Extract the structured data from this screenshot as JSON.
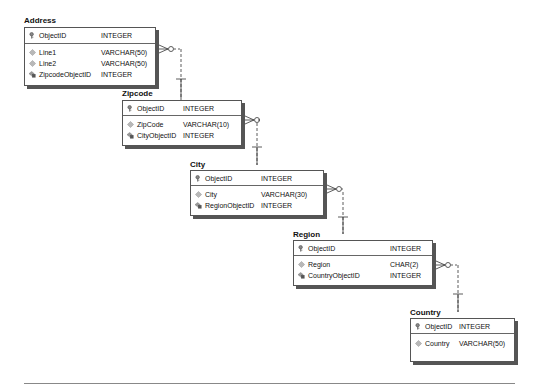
{
  "entities": [
    {
      "id": "address",
      "title": "Address",
      "pk": [
        {
          "name": "ObjectID",
          "type": "INTEGER",
          "icon": "key-icon"
        }
      ],
      "fields": [
        {
          "name": "Line1",
          "type": "VARCHAR(50)",
          "icon": "attribute-diamond-icon"
        },
        {
          "name": "Line2",
          "type": "VARCHAR(50)",
          "icon": "attribute-diamond-icon"
        },
        {
          "name": "ZipcodeObjectID",
          "type": "INTEGER",
          "icon": "foreign-key-icon"
        }
      ]
    },
    {
      "id": "zipcode",
      "title": "Zipcode",
      "pk": [
        {
          "name": "ObjectID",
          "type": "INTEGER",
          "icon": "key-icon"
        }
      ],
      "fields": [
        {
          "name": "ZipCode",
          "type": "VARCHAR(10)",
          "icon": "attribute-diamond-icon"
        },
        {
          "name": "CityObjectID",
          "type": "INTEGER",
          "icon": "foreign-key-icon"
        }
      ]
    },
    {
      "id": "city",
      "title": "City",
      "pk": [
        {
          "name": "ObjectID",
          "type": "INTEGER",
          "icon": "key-icon"
        }
      ],
      "fields": [
        {
          "name": "City",
          "type": "VARCHAR(30)",
          "icon": "attribute-diamond-icon"
        },
        {
          "name": "RegionObjectID",
          "type": "INTEGER",
          "icon": "foreign-key-icon"
        }
      ]
    },
    {
      "id": "region",
      "title": "Region",
      "pk": [
        {
          "name": "ObjectID",
          "type": "INTEGER",
          "icon": "key-icon"
        }
      ],
      "fields": [
        {
          "name": "Region",
          "type": "CHAR(2)",
          "icon": "attribute-diamond-icon"
        },
        {
          "name": "CountryObjectID",
          "type": "INTEGER",
          "icon": "foreign-key-icon"
        }
      ]
    },
    {
      "id": "country",
      "title": "Country",
      "pk": [
        {
          "name": "ObjectID",
          "type": "INTEGER",
          "icon": "key-icon"
        }
      ],
      "fields": [
        {
          "name": "Country",
          "type": "VARCHAR(50)",
          "icon": "attribute-diamond-icon"
        }
      ]
    }
  ],
  "relationships": [
    {
      "from": "address",
      "to": "zipcode",
      "type": "many-to-one, optional, non-identifying"
    },
    {
      "from": "zipcode",
      "to": "city",
      "type": "many-to-one, optional, non-identifying"
    },
    {
      "from": "city",
      "to": "region",
      "type": "many-to-one, optional, non-identifying"
    },
    {
      "from": "region",
      "to": "country",
      "type": "many-to-one, optional, non-identifying"
    }
  ],
  "colors": {
    "border": "#555555",
    "shadow": "#555555",
    "text": "#111111",
    "footer_line": "#888888"
  }
}
